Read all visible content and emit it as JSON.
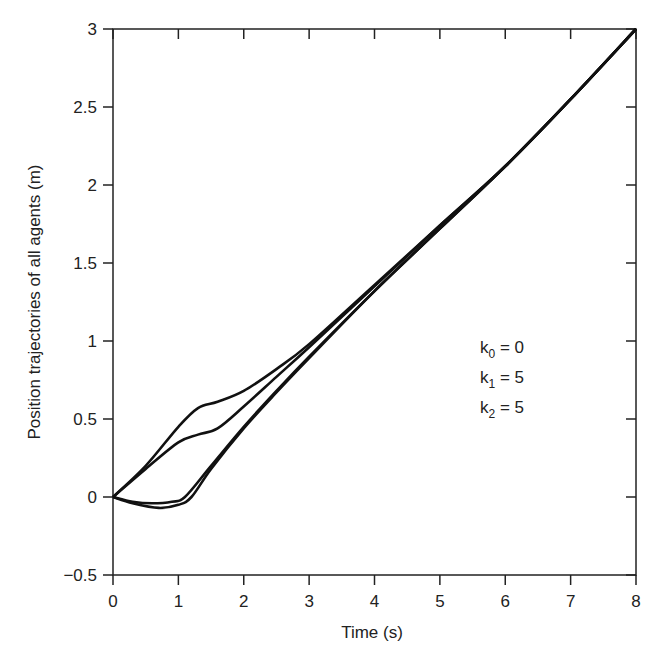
{
  "chart_data": {
    "type": "line",
    "title": "",
    "xlabel": "Time (s)",
    "ylabel": "Position trajectories of all agents (m)",
    "xlim": [
      0,
      8
    ],
    "ylim": [
      -0.5,
      3
    ],
    "xticks": [
      "0",
      "1",
      "2",
      "3",
      "4",
      "5",
      "6",
      "7",
      "8"
    ],
    "yticks": [
      "-0.5",
      "0",
      "0.5",
      "1",
      "1.5",
      "2",
      "2.5",
      "3"
    ],
    "grid": false,
    "legend": null,
    "annotations": [
      {
        "text": "k0 = 0",
        "sub": "0",
        "value": "0"
      },
      {
        "text": "k1 = 5",
        "sub": "1",
        "value": "5"
      },
      {
        "text": "k2 = 5",
        "sub": "2",
        "value": "5"
      }
    ],
    "series": [
      {
        "name": "agent-1",
        "x": [
          0,
          0.5,
          1,
          1.3,
          1.6,
          2,
          2.5,
          3,
          4,
          5,
          6,
          7,
          8
        ],
        "y": [
          0,
          0.2,
          0.45,
          0.57,
          0.61,
          0.68,
          0.82,
          0.98,
          1.36,
          1.74,
          2.12,
          2.55,
          3.0
        ]
      },
      {
        "name": "agent-2",
        "x": [
          0,
          0.5,
          1,
          1.3,
          1.6,
          2,
          2.5,
          3,
          4,
          5,
          6,
          7,
          8
        ],
        "y": [
          0,
          0.18,
          0.35,
          0.4,
          0.44,
          0.58,
          0.77,
          0.96,
          1.35,
          1.74,
          2.12,
          2.55,
          3.0
        ]
      },
      {
        "name": "agent-3",
        "x": [
          0,
          0.3,
          0.6,
          0.9,
          1.1,
          1.5,
          2,
          2.5,
          3,
          4,
          5,
          6,
          7,
          8
        ],
        "y": [
          0,
          -0.03,
          -0.04,
          -0.03,
          0,
          0.2,
          0.45,
          0.68,
          0.9,
          1.32,
          1.72,
          2.12,
          2.55,
          3.0
        ]
      },
      {
        "name": "agent-4",
        "x": [
          0,
          0.3,
          0.7,
          1,
          1.2,
          1.5,
          2,
          2.5,
          3,
          4,
          5,
          6,
          7,
          8
        ],
        "y": [
          0,
          -0.04,
          -0.07,
          -0.05,
          0,
          0.18,
          0.44,
          0.67,
          0.89,
          1.32,
          1.72,
          2.12,
          2.55,
          3.0
        ]
      }
    ]
  }
}
